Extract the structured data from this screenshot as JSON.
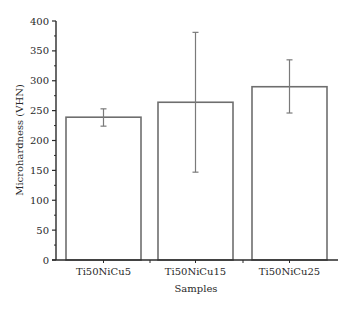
{
  "chart_data": {
    "type": "bar",
    "title": "",
    "xlabel": "Samples",
    "ylabel": "Microhardness (VHN)",
    "categories": [
      "Ti50NiCu5",
      "Ti50NiCu15",
      "Ti50NiCu25"
    ],
    "values": [
      239,
      264,
      290
    ],
    "error_bars": [
      {
        "low": 224,
        "high": 253
      },
      {
        "low": 147,
        "high": 381
      },
      {
        "low": 246,
        "high": 335
      }
    ],
    "ylim": [
      0,
      400
    ],
    "yticks": [
      0,
      50,
      100,
      150,
      200,
      250,
      300,
      350,
      400
    ],
    "yminor_step": 25,
    "grid": false,
    "legend": null,
    "colors": {
      "bar_fill": "#ffffff",
      "bar_stroke": "#6e6e6e",
      "axis": "#2a2a2a",
      "error_bar": "#7a7a7a"
    }
  }
}
